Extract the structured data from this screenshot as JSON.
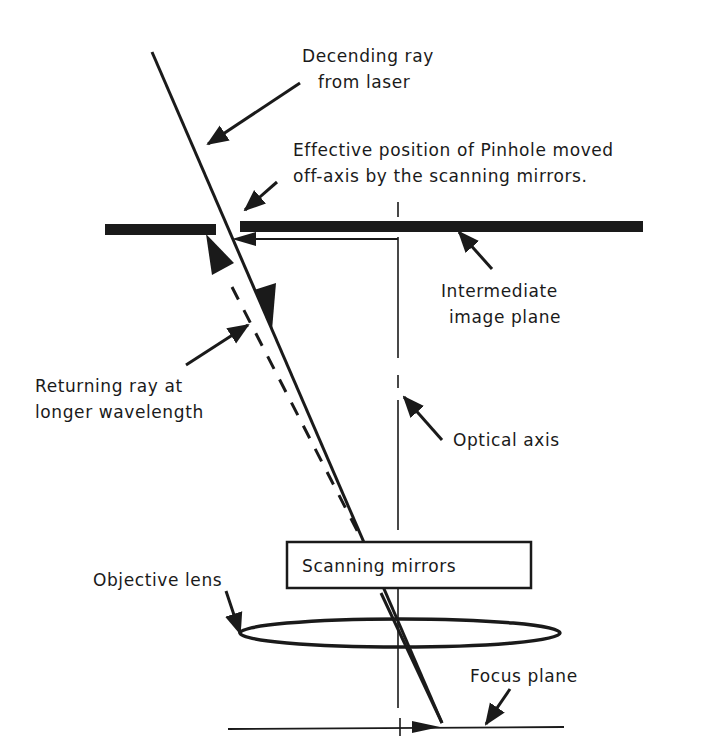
{
  "diagram": {
    "type": "confocal-optics-schematic",
    "colors": {
      "ink": "#1a1a1a",
      "background": "#ffffff"
    },
    "labels": {
      "descending_ray": [
        "Decending ray",
        "from laser"
      ],
      "pinhole": [
        "Effective position of Pinhole moved",
        "off-axis by the scanning  mirrors."
      ],
      "intermediate_plane": [
        "Intermediate",
        "image plane"
      ],
      "returning_ray": [
        "Returning ray at",
        "longer wavelength"
      ],
      "optical_axis": "Optical axis",
      "scanning_mirrors": "Scanning mirrors",
      "objective_lens": "Objective lens",
      "focus_plane": "Focus plane"
    },
    "elements": [
      "descending-ray-solid",
      "returning-ray-dashed",
      "intermediate-image-plane",
      "optical-axis",
      "scanning-mirrors-box",
      "objective-lens-ellipse",
      "focus-plane-line"
    ]
  }
}
